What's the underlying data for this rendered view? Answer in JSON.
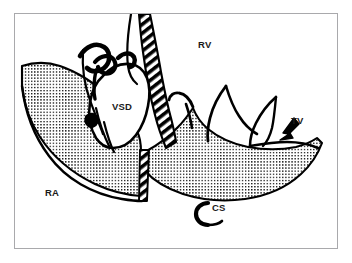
{
  "figure": {
    "kind": "anatomical-line-diagram",
    "border_color": "#a9a9ac",
    "ink_color": "#000000",
    "background_color": "#ffffff"
  },
  "labels": [
    {
      "id": "rv",
      "text": "RV",
      "name": "label-right-ventricle",
      "x": 198,
      "y": 48
    },
    {
      "id": "vsd",
      "text": "VSD",
      "name": "label-ventricular-septal-defect",
      "x": 112,
      "y": 110
    },
    {
      "id": "tv",
      "text": "TV",
      "name": "label-tricuspid-valve",
      "x": 291,
      "y": 124
    },
    {
      "id": "ra",
      "text": "RA",
      "name": "label-right-atrium",
      "x": 45,
      "y": 196
    },
    {
      "id": "cs",
      "text": "CS",
      "name": "label-coronary-sinus",
      "x": 212,
      "y": 211
    }
  ],
  "markers": [
    {
      "id": "tv-arrow",
      "name": "tricuspid-valve-arrow",
      "description": "solid wedge arrow pointing down-left toward the tricuspid valve"
    },
    {
      "id": "cs-hook",
      "name": "coronary-sinus-marker",
      "description": "thick crescent C-shaped marker indicating the coronary sinus orifice"
    }
  ],
  "regions": [
    {
      "id": "ra-wall",
      "name": "right-atrial-wall-stipple",
      "fill": "stipple"
    },
    {
      "id": "septum-base",
      "name": "septal-base-stipple",
      "fill": "stipple"
    },
    {
      "id": "patch-band",
      "name": "hatched-septal-band",
      "fill": "diagonal-hatch"
    }
  ]
}
